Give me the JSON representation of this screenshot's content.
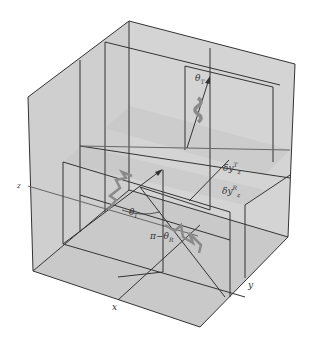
{
  "diagram": {
    "colors": {
      "face": "#cfcfcf",
      "edge": "#333333",
      "wave": "#8a8a8a",
      "background": "#ffffff"
    },
    "axes": {
      "x": "x",
      "y": "y",
      "z": "z"
    },
    "labels": {
      "theta_T": "θ",
      "theta_T_sub": "T",
      "theta_I": "θ",
      "theta_I_sub": "I",
      "pi_minus": "π−θ",
      "pi_minus_sub": "R",
      "dy_T": "δy",
      "dy_T_sup": "T",
      "dy_T_sub": "z",
      "dy_R": "δy",
      "dy_R_sup": "R",
      "dy_R_sub": "z"
    }
  }
}
